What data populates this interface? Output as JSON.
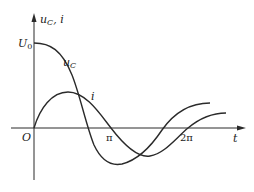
{
  "diagram": {
    "y_axis_label_main": "u",
    "y_axis_label_sub": "C",
    "y_axis_label_rest": ", i",
    "x_axis_label": "t",
    "origin_label": "O",
    "u0_label_main": "U",
    "u0_label_sub": "0",
    "ticks": [
      {
        "label": "π",
        "x": 111
      },
      {
        "label": "2π",
        "x": 188
      }
    ],
    "curves": [
      {
        "name": "uC",
        "label_main": "u",
        "label_sub": "C"
      },
      {
        "name": "i",
        "label": "i"
      }
    ]
  }
}
